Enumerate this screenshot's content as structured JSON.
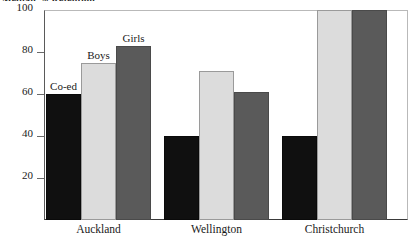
{
  "chart_data": {
    "type": "bar",
    "title": "Median % Retention",
    "xlabel": "",
    "ylabel": "",
    "ylim": [
      0,
      100
    ],
    "yticks": [
      0,
      20,
      40,
      60,
      80,
      100
    ],
    "ytick_labels": [
      "",
      "20",
      "40",
      "60",
      "80",
      "100"
    ],
    "grid": false,
    "legend_position": "inline-above-bars",
    "categories": [
      "Auckland",
      "Wellington",
      "Christchurch"
    ],
    "series": [
      {
        "name": "Co-ed",
        "color": "#101010",
        "values": [
          60,
          40,
          40
        ]
      },
      {
        "name": "Boys",
        "color": "#dcdcdc",
        "values": [
          75,
          71,
          100
        ]
      },
      {
        "name": "Girls",
        "color": "#5a5a5a",
        "values": [
          83,
          61,
          100
        ]
      }
    ],
    "annotations": [
      "Co-ed",
      "Boys",
      "Girls"
    ]
  },
  "axis": {
    "ticks": [
      {
        "value": 100,
        "label": "100"
      },
      {
        "value": 80,
        "label": "80"
      },
      {
        "value": 60,
        "label": "60"
      },
      {
        "value": 40,
        "label": "40"
      },
      {
        "value": 20,
        "label": "20"
      }
    ]
  },
  "title": {
    "text": "Median % Retention"
  }
}
